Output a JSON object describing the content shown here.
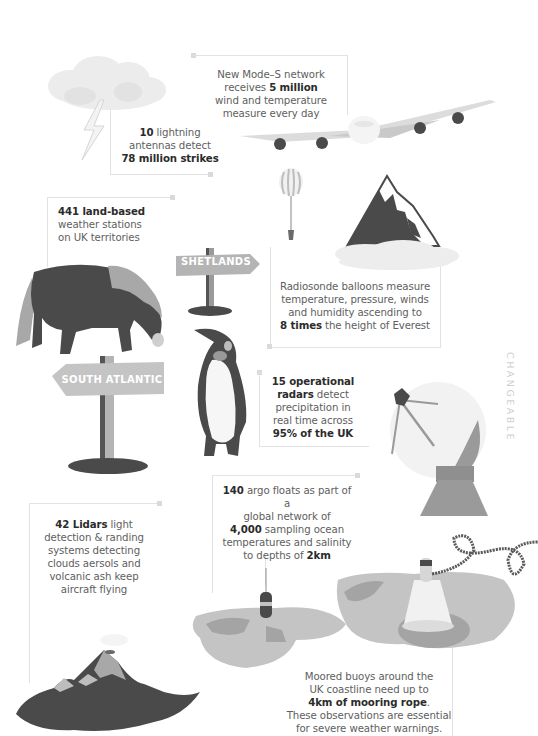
{
  "side_label": "CHANGEABLE",
  "facts": {
    "mode_s": {
      "pre": "New Mode–S network",
      "line2_pre": "receives ",
      "line2_bold": "5 million",
      "line3": "wind and temperature",
      "line4": "measure every day"
    },
    "lightning": {
      "bold1": "10",
      "rest1": " lightning",
      "line2": "antennas detect",
      "bold3": "78 million strikes"
    },
    "land_stations": {
      "bold1": "441 land-based",
      "line2": "weather stations",
      "line3": "on UK territories"
    },
    "radiosonde": {
      "line1": "Radiosonde balloons measure",
      "line2": "temperature, pressure, winds",
      "line3": "and humidity ascending to",
      "bold4": "8 times",
      "rest4": " the height of Everest"
    },
    "radars": {
      "bold1": "15 operational",
      "bold2": "radars",
      "rest2": " detect",
      "line3": "precipitation in",
      "line4": "real time across",
      "bold5": "95% of the UK"
    },
    "argo": {
      "bold1": "140",
      "rest1": " argo floats as part of a",
      "line2": "global network of",
      "bold3": "4,000",
      "rest3": " sampling ocean",
      "line4": "temperatures and salinity",
      "pre5": "to depths of ",
      "bold5": "2km"
    },
    "lidars": {
      "bold1": "42 Lidars",
      "rest1": " light",
      "line2": "detection & randing",
      "line3": "systems detecting",
      "line4": "clouds aersols and",
      "line5": "volcanic ash keep",
      "line6": "aircraft flying"
    },
    "buoys": {
      "line1": "Moored buoys around the",
      "line2": "UK coastline need up to",
      "bold3": "4km of mooring rope",
      "rest3": ".",
      "line4": "These observations are essential",
      "line5": "for severe weather warnings."
    }
  },
  "signs": {
    "shetlands": "SHETLANDS",
    "south_atlantic": "SOUTH ATLANTIC"
  },
  "colors": {
    "dark": "#4a4a4a",
    "mid": "#8f8f8f",
    "light": "#c8c8c8",
    "lighter": "#e3e3e3",
    "line": "#e2e2e2",
    "text": "#5e5e5e",
    "bold_text": "#2b2b2b"
  }
}
